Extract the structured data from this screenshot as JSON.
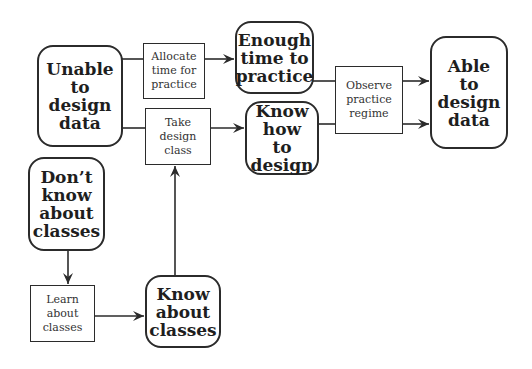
{
  "diagram": {
    "type": "flowchart",
    "colors": {
      "stroke": "#2b2b2b",
      "text": "#1e1e1e",
      "background": "#ffffff"
    },
    "states": {
      "unable": {
        "label": "Unable\nto\ndesign\ndata"
      },
      "enough_time": {
        "label": "Enough\ntime to\npractice"
      },
      "know_how": {
        "label": "Know\nhow\nto design"
      },
      "able": {
        "label": "Able\nto\ndesign\ndata"
      },
      "dont_know": {
        "label": "Don’t\nknow\nabout\nclasses"
      },
      "know_about": {
        "label": "Know\nabout\nclasses"
      }
    },
    "actions": {
      "allocate": {
        "label": "Allocate\ntime for\npractice"
      },
      "take_class": {
        "label": "Take\ndesign\nclass"
      },
      "observe": {
        "label": "Observe\npractice\nregime"
      },
      "learn": {
        "label": "Learn\nabout\nclasses"
      }
    },
    "edges": [
      {
        "from": "Unable to design data",
        "via": "Allocate time for practice",
        "to": "Enough time to practice"
      },
      {
        "from": "Unable to design data",
        "via": "Take design class",
        "to": "Know how to design"
      },
      {
        "from": "Know about classes",
        "via": "Take design class",
        "to": "Know how to design"
      },
      {
        "from": "Enough time to practice",
        "via": "Observe practice regime",
        "to": "Able to design data"
      },
      {
        "from": "Know how to design",
        "via": "Observe practice regime",
        "to": "Able to design data"
      },
      {
        "from": "Don’t know about classes",
        "via": "Learn about classes",
        "to": "Know about classes"
      }
    ]
  }
}
